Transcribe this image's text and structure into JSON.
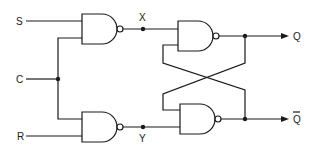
{
  "diagram": {
    "inputs": {
      "s": "S",
      "c": "C",
      "r": "R"
    },
    "nodes": {
      "x": "X",
      "y": "Y"
    },
    "outputs": {
      "q": "Q",
      "q_bar": "Q"
    },
    "gates": [
      {
        "id": "g1",
        "type": "NAND",
        "inputs": [
          "S",
          "C"
        ],
        "output": "X"
      },
      {
        "id": "g2",
        "type": "NAND",
        "inputs": [
          "C",
          "R"
        ],
        "output": "Y"
      },
      {
        "id": "g3",
        "type": "NAND",
        "inputs": [
          "X",
          "Q̄"
        ],
        "output": "Q"
      },
      {
        "id": "g4",
        "type": "NAND",
        "inputs": [
          "Q",
          "Y"
        ],
        "output": "Q̄"
      }
    ],
    "colors": {
      "stroke": "#1a1a1a",
      "background": "#ffffff"
    }
  }
}
